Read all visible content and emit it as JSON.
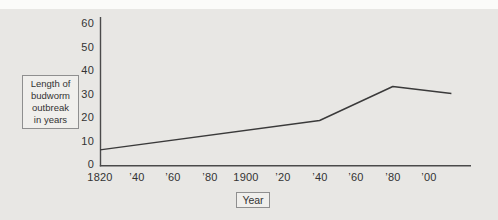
{
  "figure": {
    "description_visible_text_only": true,
    "colors": {
      "panel_background": "#e8e7e4",
      "top_band": "#fbfbf9",
      "axis": "#4a4a4a",
      "data_line": "#3a3a3a",
      "text": "#333333",
      "box_border": "#8f8f8f",
      "box_fill": "#f0efec"
    }
  },
  "y_axis_label": {
    "lines": [
      "Length of",
      "budworm",
      "outbreak",
      "in years"
    ]
  },
  "chart_data": {
    "type": "line",
    "title": "",
    "xlabel": "Year",
    "ylabel": "Length of budworm outbreak in years",
    "grid": false,
    "legend": "none",
    "ylim": [
      0,
      60
    ],
    "xlim": [
      1820,
      2023
    ],
    "y_tick_labels": [
      "60",
      "50",
      "40",
      "30",
      "20",
      "10",
      "0"
    ],
    "y_tick_values": [
      60,
      50,
      40,
      30,
      20,
      10,
      0
    ],
    "x_tick_labels": [
      "1820",
      "’40",
      "’60",
      "’80",
      "1900",
      "’20",
      "’40",
      "’60",
      "’80",
      "’00"
    ],
    "x_tick_years": [
      1820,
      1840,
      1860,
      1880,
      1900,
      1920,
      1940,
      1960,
      1980,
      2000
    ],
    "series": [
      {
        "name": "budworm-outbreak-length",
        "vertices": [
          {
            "year": 1820,
            "value": 6
          },
          {
            "year": 1940,
            "value": 18.5
          },
          {
            "year": 1980,
            "value": 33
          },
          {
            "year": 2012,
            "value": 30
          }
        ],
        "sampled_at_ticks": {
          "years": [
            1820,
            1840,
            1860,
            1880,
            1900,
            1920,
            1940,
            1960,
            1980,
            2000
          ],
          "values": [
            6,
            8,
            10,
            12,
            14.5,
            16.5,
            18.5,
            26,
            33,
            31.5
          ]
        }
      }
    ]
  }
}
